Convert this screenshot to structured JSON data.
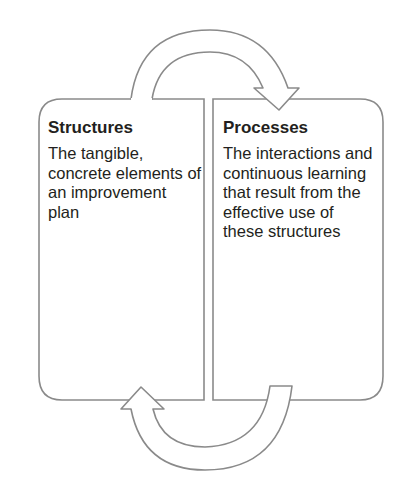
{
  "diagram": {
    "type": "cycle",
    "colors": {
      "stroke": "#8a8a8a",
      "fill": "#ffffff",
      "text": "#231f20"
    },
    "boxes": [
      {
        "id": "structures",
        "title": "Structures",
        "body": "The tangible, concrete elements of an improvement plan"
      },
      {
        "id": "processes",
        "title": "Processes",
        "body": "The interactions and continuous learning that result from the effective use of these structures"
      }
    ],
    "arrows": [
      {
        "from": "structures",
        "to": "processes",
        "position": "top"
      },
      {
        "from": "processes",
        "to": "structures",
        "position": "bottom"
      }
    ]
  }
}
